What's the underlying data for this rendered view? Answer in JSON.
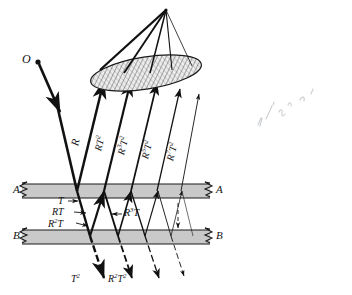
{
  "figure": {
    "source_label": "O",
    "surface_top_label_left": "A",
    "surface_top_label_right": "A",
    "surface_bottom_label_left": "B",
    "surface_bottom_label_right": "B",
    "colors": {
      "ink": "#111111",
      "slab_fill": "#c9c9c9",
      "slab_stroke": "#1a1a1a",
      "lens_fill": "#e8e8e8",
      "lens_hatch": "#3a3a3a",
      "pencil": "#9aa0a6",
      "paper": "#ffffff"
    },
    "reflected_rays": [
      {
        "label": "R",
        "base": "R",
        "exp_r": "",
        "exp_t": ""
      },
      {
        "label": "RT2",
        "base": "R",
        "exp_r": "",
        "exp_t": "2"
      },
      {
        "label": "R3T2",
        "base": "R",
        "exp_r": "3",
        "exp_t": "2"
      },
      {
        "label": "R5T2",
        "base": "R",
        "exp_r": "5",
        "exp_t": "2"
      },
      {
        "label": "R7T2",
        "base": "R",
        "exp_r": "7",
        "exp_t": "2"
      }
    ],
    "internal_labels": [
      {
        "id": "T",
        "text": "T"
      },
      {
        "id": "RT",
        "text": "RT"
      },
      {
        "id": "R2T",
        "text": "R2T"
      },
      {
        "id": "R3T",
        "text": "R3T"
      }
    ],
    "transmitted_labels": [
      {
        "id": "T2",
        "text": "T2"
      },
      {
        "id": "R2T2",
        "text": "R2T2"
      }
    ],
    "annotation": {
      "text": "10-8 in a l",
      "kind": "handwritten-pencil-note"
    }
  }
}
